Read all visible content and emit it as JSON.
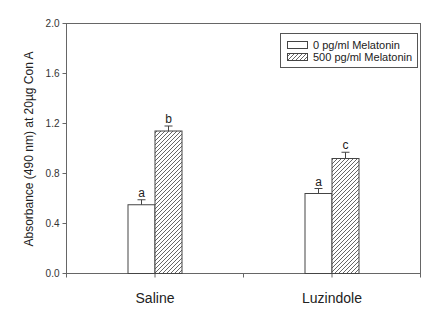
{
  "chart_data": {
    "type": "bar",
    "title": "",
    "xlabel": "",
    "ylabel": "Absorbance (490 nm) at 20µg Con A",
    "ylim": [
      0.0,
      2.0
    ],
    "yticks": [
      "0.0",
      "0.4",
      "0.8",
      "1.2",
      "1.6",
      "2.0"
    ],
    "categories": [
      "Saline",
      "Luzindole"
    ],
    "series": [
      {
        "name": "0 pg/ml Melatonin",
        "fill": "white",
        "values": [
          0.55,
          0.64
        ],
        "errors": [
          0.04,
          0.04
        ],
        "sig_labels": [
          "a",
          "a"
        ]
      },
      {
        "name": "500 pg/ml Melatonin",
        "fill": "hatched",
        "values": [
          1.14,
          0.92
        ],
        "errors": [
          0.04,
          0.05
        ],
        "sig_labels": [
          "b",
          "c"
        ]
      }
    ],
    "legend": {
      "position": "upper right",
      "entries": [
        "0 pg/ml Melatonin",
        "500 pg/ml Melatonin"
      ]
    },
    "grid": false,
    "colors": {
      "axis": "#555555",
      "bar_edge": "#444444",
      "hatch": "#555555"
    }
  }
}
